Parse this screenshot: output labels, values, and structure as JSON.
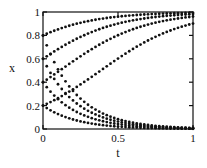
{
  "figure": {
    "background": "#ffffff",
    "frame_color": "#111111",
    "dot_color": "#111111",
    "dot_radius": 1.4,
    "tick_length": 4
  },
  "chart_data": {
    "type": "scatter",
    "title": "",
    "xlabel": "t",
    "ylabel": "x",
    "xlim": [
      0,
      1
    ],
    "ylim": [
      0,
      1
    ],
    "grid": false,
    "legend": "none",
    "frame": "box-with-mirrored-ticks",
    "xticks": [
      0,
      0.5,
      1
    ],
    "xtick_labels": [
      "0",
      "0.5",
      "1"
    ],
    "yticks": [
      0,
      0.2,
      0.4,
      0.6,
      0.8,
      1
    ],
    "ytick_labels": [
      "0",
      "0.2",
      "0.4",
      "0.6",
      "0.8",
      "1"
    ],
    "marker": "filled-dot",
    "sampling": {
      "t_min": 0,
      "t_max": 1,
      "n_points": 41
    },
    "series": [
      {
        "name": "growth from x0=0.2",
        "model": "logistic_growth",
        "x0": 0.2,
        "rate": 3.6,
        "x_at_t1": 0.9
      },
      {
        "name": "growth from x0=0.4",
        "model": "logistic_growth",
        "x0": 0.4,
        "rate": 3.6,
        "x_at_t1": 0.96
      },
      {
        "name": "growth from x0=0.6",
        "model": "logistic_growth",
        "x0": 0.6,
        "rate": 3.6,
        "x_at_t1": 0.98
      },
      {
        "name": "growth from x0=0.8",
        "model": "logistic_growth",
        "x0": 0.8,
        "rate": 3.6,
        "x_at_t1": 0.99
      },
      {
        "name": "decay from x0=0.2",
        "model": "exponential_decay",
        "x0": 0.2,
        "rate": 4.5,
        "x_at_t1": 0.0
      },
      {
        "name": "decay from x0=0.4",
        "model": "exponential_decay",
        "x0": 0.4,
        "rate": 4.5,
        "x_at_t1": 0.0
      },
      {
        "name": "decay from x0=0.6",
        "model": "exponential_decay",
        "x0": 0.6,
        "rate": 4.5,
        "x_at_t1": 0.01
      },
      {
        "name": "decay from x0=0.8",
        "model": "exponential_decay",
        "x0": 0.8,
        "rate": 4.5,
        "x_at_t1": 0.01
      }
    ],
    "plot_box_px": {
      "left": 43,
      "top": 12,
      "right": 193,
      "bottom": 129
    }
  }
}
